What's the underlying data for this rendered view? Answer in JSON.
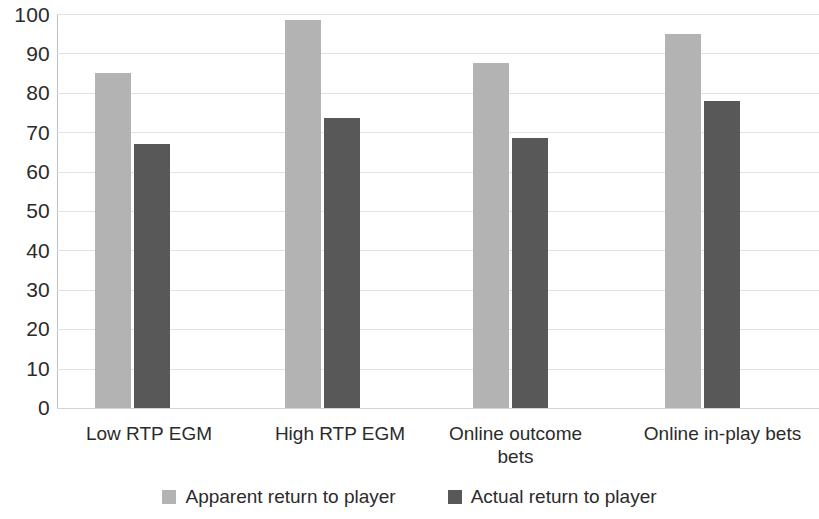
{
  "chart_data": {
    "type": "bar",
    "title": "",
    "subtitle": "",
    "xlabel": "",
    "ylabel": "",
    "ylim": [
      0,
      100
    ],
    "y_ticks": [
      0,
      10,
      20,
      30,
      40,
      50,
      60,
      70,
      80,
      90,
      100
    ],
    "grid": true,
    "legend_position": "bottom",
    "categories": [
      "Low RTP EGM",
      "High RTP EGM",
      "Online outcome bets",
      "Online in-play bets"
    ],
    "series": [
      {
        "name": "Apparent return to player",
        "color": "#b3b3b3",
        "values": [
          85,
          98.5,
          87.5,
          95
        ]
      },
      {
        "name": "Actual return to player",
        "color": "#585858",
        "values": [
          67,
          73.5,
          68.5,
          78
        ]
      }
    ]
  },
  "axis": {
    "y_tick_labels": [
      "100",
      "90",
      "80",
      "70",
      "60",
      "50",
      "40",
      "30",
      "20",
      "10",
      "0"
    ],
    "category_labels": [
      "Low RTP EGM",
      "High RTP EGM",
      "Online outcome bets",
      "Online in-play bets"
    ]
  },
  "legend": {
    "items": [
      {
        "label": "Apparent return to player",
        "color": "#b3b3b3"
      },
      {
        "label": "Actual return to player",
        "color": "#585858"
      }
    ]
  }
}
